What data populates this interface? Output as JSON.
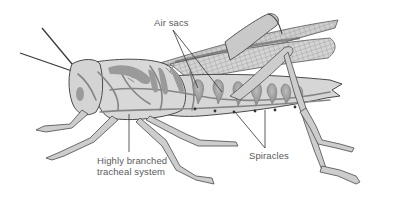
{
  "diagram": {
    "labels": {
      "air_sacs": "Air sacs",
      "tracheal_line1": "Highly branched",
      "tracheal_line2": "tracheal system",
      "spiracles": "Spiracles"
    },
    "colors": {
      "body_fill": "#d6d6d6",
      "outline": "#4a4a4a",
      "trachea": "#8a8a8a",
      "air_sac": "#9c9c9c",
      "wing": "#c8c8c8",
      "label_text": "#5a5a5a",
      "leader_line": "#333333"
    }
  }
}
